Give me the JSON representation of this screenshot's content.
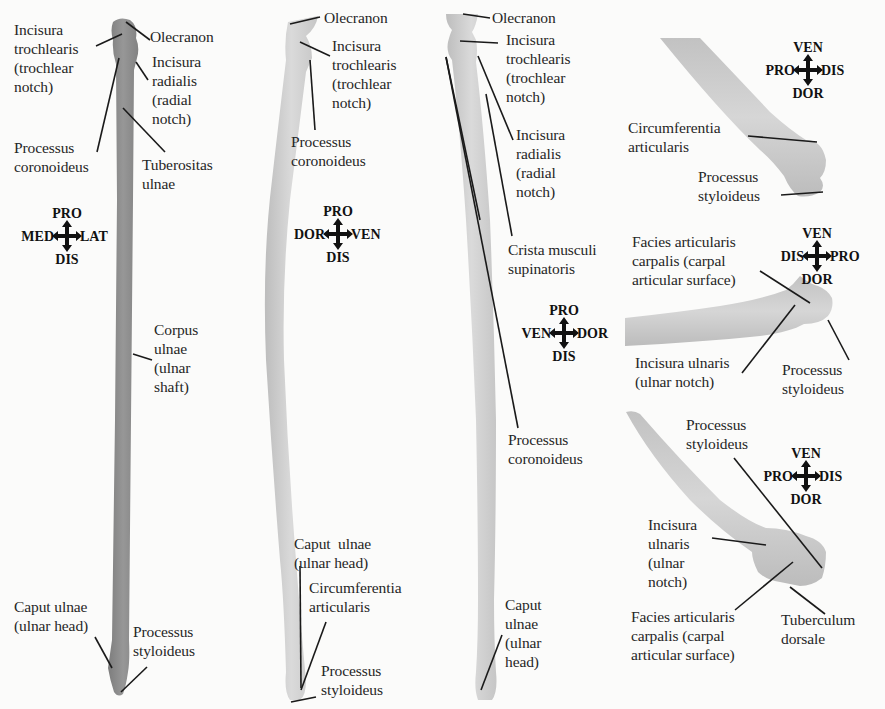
{
  "figure": {
    "colors": {
      "background": "#fbfbfa",
      "ulna_dark": "#8e8e8e",
      "bone_light": "#cfcfcf",
      "leader_line": "#1a1a1a",
      "text": "#262626"
    }
  },
  "panel1": {
    "labels": {
      "incisura_trochlearis": "Incisura\ntrochlearis\n(trochlear\nnotch)",
      "olecranon": "Olecranon",
      "incisura_radialis": "Incisura\nradialis\n(radial\nnotch)",
      "processus_coronoideus": "Processus\ncoronoideus",
      "tuberositas_ulnae": "Tuberositas\nulnae",
      "corpus_ulnae": "Corpus\nulnae\n(ulnar\nshaft)",
      "caput_ulnae": "Caput ulnae\n(ulnar head)",
      "processus_styloideus": "Processus\nstyloideus"
    },
    "compass": {
      "top": "PRO",
      "bottom": "DIS",
      "left": "MED",
      "right": "LAT"
    }
  },
  "panel2": {
    "labels": {
      "olecranon": "Olecranon",
      "incisura_trochlearis": "Incisura\ntrochlearis\n(trochlear\nnotch)",
      "processus_coronoideus": "Processus\ncoronoideus",
      "caput_ulnae": "Caput  ulnae\n(ulnar head)",
      "circumferentia_articularis": "Circumferentia\narticularis",
      "processus_styloideus": "Processus\nstyloideus"
    },
    "compass": {
      "top": "PRO",
      "bottom": "DIS",
      "left": "DOR",
      "right": "VEN"
    }
  },
  "panel3": {
    "labels": {
      "olecranon": "Olecranon",
      "incisura_trochlearis": "Incisura\ntrochlearis\n(trochlear\nnotch)",
      "incisura_radialis": "Incisura\nradialis\n(radial\nnotch)",
      "crista_musculi_supinatoris": "Crista musculi\nsupinatoris",
      "processus_coronoideus": "Processus\ncoronoideus",
      "caput_ulnae": "Caput\nulnae\n(ulnar\nhead)"
    },
    "compass": {
      "top": "PRO",
      "bottom": "DIS",
      "left": "VEN",
      "right": "DOR"
    }
  },
  "panel4a": {
    "labels": {
      "circumferentia_articularis": "Circumferentia\narticularis",
      "processus_styloideus": "Processus\nstyloideus"
    },
    "compass": {
      "top": "VEN",
      "bottom": "DOR",
      "left": "PRO",
      "right": "DIS"
    }
  },
  "panel4b": {
    "labels": {
      "facies_articularis_carpalis": "Facies articularis\ncarpalis (carpal\narticular surface)",
      "incisura_ulnaris": "Incisura ulnaris\n(ulnar notch)",
      "processus_styloideus": "Processus\nstyloideus"
    },
    "compass": {
      "top": "VEN",
      "bottom": "DOR",
      "left": "DIS",
      "right": "PRO"
    }
  },
  "panel4c": {
    "labels": {
      "processus_styloideus": "Processus\nstyloideus",
      "incisura_ulnaris": "Incisura\nulnaris\n(ulnar\nnotch)",
      "facies_articularis_carpalis": "Facies articularis\ncarpalis (carpal\narticular surface)",
      "tuberculum_dorsale": "Tuberculum\ndorsale"
    },
    "compass": {
      "top": "VEN",
      "bottom": "DOR",
      "left": "PRO",
      "right": "DIS"
    }
  }
}
